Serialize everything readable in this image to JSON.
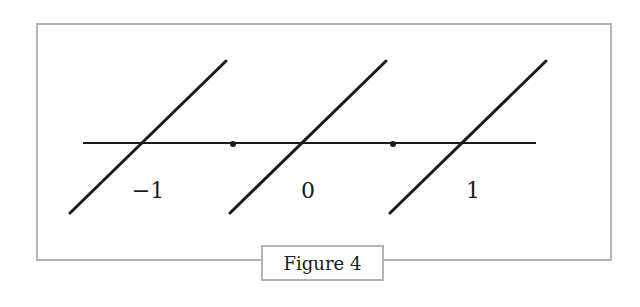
{
  "figure": {
    "caption": "Figure 4",
    "axis": {
      "x_range": [
        -1.5,
        1.5
      ],
      "color": "#1a1a1a"
    },
    "segments": [
      {
        "x_center": -1,
        "label": "−1"
      },
      {
        "x_center": 0,
        "label": "0"
      },
      {
        "x_center": 1,
        "label": "1"
      }
    ],
    "endpoints": [
      {
        "x": -0.5
      },
      {
        "x": 0.5
      }
    ],
    "colors": {
      "frame": "#b4b4b4",
      "ink": "#1a1a1a",
      "background": "#ffffff"
    }
  }
}
